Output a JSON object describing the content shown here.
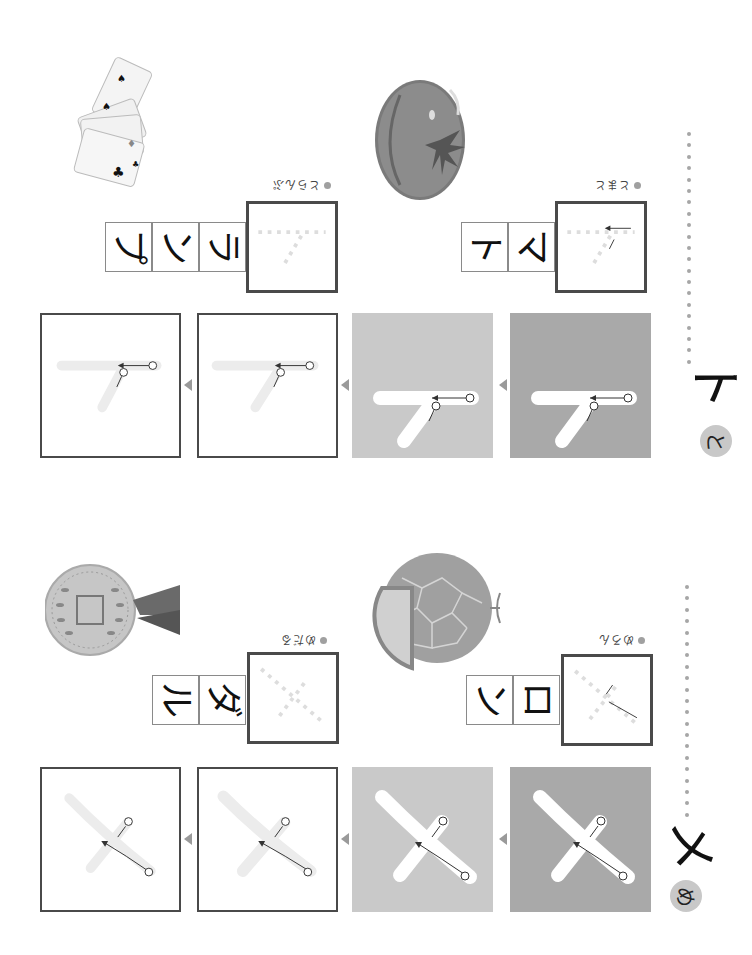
{
  "sections": [
    {
      "id": "to",
      "katakana": "ト",
      "hiragana": "と",
      "examples": [
        {
          "word_reading": "とまと",
          "tiles": [
            "マ",
            "ト"
          ],
          "illustration": "tomato-illustration"
        },
        {
          "word_reading": "とらんぷ",
          "tiles": [
            "ラ",
            "ン",
            "プ"
          ],
          "illustration": "playing-cards-illustration"
        }
      ],
      "stroke_labels": [
        "①",
        "②"
      ]
    },
    {
      "id": "me",
      "katakana": "メ",
      "hiragana": "め",
      "examples": [
        {
          "word_reading": "めろん",
          "tiles": [
            "ロ",
            "ン"
          ],
          "illustration": "melon-illustration"
        },
        {
          "word_reading": "めだる",
          "tiles": [
            "ダ",
            "ル"
          ],
          "illustration": "medal-illustration"
        }
      ],
      "stroke_labels": [
        "①",
        "②"
      ]
    }
  ],
  "colors": {
    "panel_dark": "#a9a9a9",
    "panel_mid": "#c9c9c9",
    "frame": "#4a4a4a",
    "guide": "#d9d9d9",
    "circle": "#c8c8c8"
  }
}
